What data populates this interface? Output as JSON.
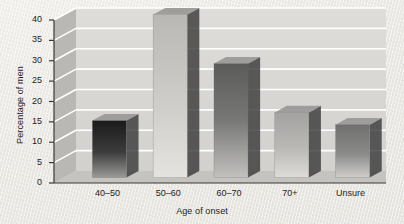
{
  "chart_data": {
    "type": "bar",
    "title": "",
    "xlabel": "Age of onset",
    "ylabel": "Percentage of men",
    "categories": [
      "40–50",
      "50–60",
      "60–70",
      "70+",
      "Unsure"
    ],
    "values": [
      14,
      40,
      28,
      16,
      13
    ],
    "yticks": [
      0,
      5,
      10,
      15,
      20,
      25,
      30,
      35,
      40
    ],
    "ylim": [
      0,
      40
    ],
    "grid": true,
    "legend": "none",
    "style": "3d-bars",
    "bar_colors": [
      "#2f2f2f",
      "#c9c8c6",
      "#6e6e6e",
      "#b0afae",
      "#8a8a88"
    ]
  },
  "figure": {
    "background_color": "#eceae6",
    "plot_back_color": "#d6d5d2",
    "plot_side_color": "#b7b6b3",
    "plot_floor_color": "#c2c1be",
    "gridline_color": "#ffffff",
    "axis_color": "#3a3a3a",
    "text_color": "#1d1d1d"
  }
}
